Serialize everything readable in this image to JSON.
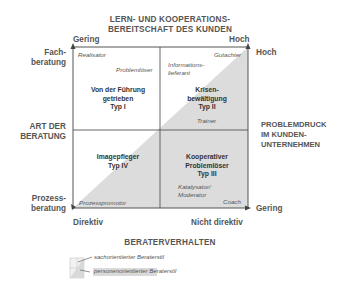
{
  "title": {
    "line1": "LERN- UND KOOPERATIONS-",
    "line2": "BEREITSCHAFT DES KUNDEN"
  },
  "top_axis": {
    "left": "Gering",
    "right": "Hoch"
  },
  "left_axis": {
    "title_line1": "ART DER",
    "title_line2": "BERATUNG",
    "top_line1": "Fach-",
    "top_line2": "beratung",
    "bottom_line1": "Prozess-",
    "bottom_line2": "beratung"
  },
  "right_axis": {
    "top": "Hoch",
    "title_line1": "PROBLEMDRUCK",
    "title_line2": "IM KUNDEN-",
    "title_line3": "UNTERNEHMEN",
    "bottom": "Gering"
  },
  "bottom_axis": {
    "left": "Direktiv",
    "right": "Nicht direktiv",
    "title": "BERATERVERHALTEN"
  },
  "quadrants": {
    "top_left": {
      "line1": "Von der Führung",
      "line2": "getrieben",
      "line3": "Typ I",
      "roles": [
        "Realisator",
        "Problemlöser"
      ]
    },
    "top_right": {
      "line1": "Krisen-",
      "line2": "bewältigung",
      "line3": "Typ II",
      "roles": [
        "Informations-",
        "lieferant",
        "Gutachter",
        "Trainer"
      ]
    },
    "bottom_left": {
      "line1": "Imagepfleger",
      "line2": "Typ IV",
      "roles": [
        "Prozesspromotor"
      ]
    },
    "bottom_right": {
      "line1": "Kooperativer",
      "line2": "Problemlöser",
      "line3": "Typ III",
      "roles": [
        "Katalysator/",
        "Moderator",
        "Coach"
      ]
    }
  },
  "legend": {
    "items": [
      {
        "label": "sachorientierter Beraterstil",
        "swatch": "#ffffff"
      },
      {
        "label": "personenorientierter Beraterstil",
        "swatch": "#d9d9d9"
      }
    ]
  },
  "colors": {
    "shade": "#dcdcdc",
    "line": "#555555",
    "text": "#444444"
  }
}
